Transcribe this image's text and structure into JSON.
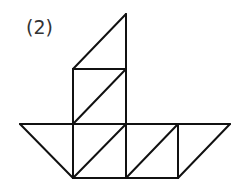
{
  "figure": {
    "label": "(2)",
    "stroke_color": "#111111",
    "stroke_width": 2,
    "segments": [
      {
        "name": "sail-top-diagonal",
        "x1": 73,
        "y1": 69,
        "x2": 126,
        "y2": 14
      },
      {
        "name": "mast-right",
        "x1": 126,
        "y1": 14,
        "x2": 126,
        "y2": 178
      },
      {
        "name": "sail-mid-horizontal",
        "x1": 73,
        "y1": 69,
        "x2": 126,
        "y2": 69
      },
      {
        "name": "sail-left-vertical",
        "x1": 73,
        "y1": 69,
        "x2": 73,
        "y2": 178
      },
      {
        "name": "sail-mid-diagonal",
        "x1": 73,
        "y1": 124,
        "x2": 126,
        "y2": 69
      },
      {
        "name": "deck-top",
        "x1": 20,
        "y1": 124,
        "x2": 230,
        "y2": 124
      },
      {
        "name": "hull-left-slope",
        "x1": 20,
        "y1": 124,
        "x2": 73,
        "y2": 178
      },
      {
        "name": "hull-bottom",
        "x1": 73,
        "y1": 178,
        "x2": 178,
        "y2": 178
      },
      {
        "name": "hull-diag-1",
        "x1": 73,
        "y1": 178,
        "x2": 126,
        "y2": 124
      },
      {
        "name": "hull-diag-2",
        "x1": 126,
        "y1": 178,
        "x2": 178,
        "y2": 124
      },
      {
        "name": "hull-right-vertical",
        "x1": 178,
        "y1": 124,
        "x2": 178,
        "y2": 178
      },
      {
        "name": "hull-right-slope",
        "x1": 178,
        "y1": 178,
        "x2": 230,
        "y2": 124
      }
    ]
  }
}
